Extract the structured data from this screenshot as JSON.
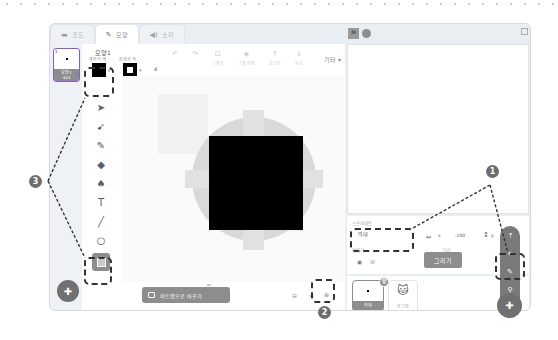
{
  "tabs": [
    {
      "label": "코드",
      "icon": "code-icon"
    },
    {
      "label": "모양",
      "icon": "brush-icon"
    },
    {
      "label": "소리",
      "icon": "speaker-icon"
    }
  ],
  "costume_list": {
    "items": [
      {
        "number": "1",
        "name": "모양1",
        "size": "4x4"
      }
    ],
    "add_button_icon": "cat-plus-icon"
  },
  "paint_editor": {
    "costume_name": "모양1",
    "fill_label": "채우기 색",
    "outline_label": "윤곽선 색",
    "outline_width": "4",
    "fill_color": "#000000",
    "outline_color": "#000000",
    "toolbar": {
      "undo": "↶",
      "redo": "↷",
      "group_label": "그룹화",
      "ungroup_label": "그룹 해제",
      "forward_label": "앞으로",
      "backward_label": "뒤로",
      "more_label": "기타 ▾"
    },
    "tools": [
      "select",
      "reshape",
      "brush",
      "eraser",
      "fill",
      "text",
      "line",
      "circle",
      "rectangle"
    ],
    "selected_tool": "rectangle",
    "convert_button": "비트맵으로 바꾸기",
    "zoom_out": "⊖",
    "zoom_reset": "=",
    "zoom_in": "⊕"
  },
  "stage": {
    "flag_icon": "green-flag-icon",
    "stop_icon": "stop-icon"
  },
  "sprite_info": {
    "sprite_label": "스프라이트",
    "sprite_name": "막대",
    "x_label": "x",
    "x_value": "-200",
    "y_label": "y",
    "show_label": "보이기",
    "size_label": "크기",
    "size_value": "36"
  },
  "sprite_menu": {
    "tooltip": "그리기",
    "items": [
      "upload-icon",
      "surprise-icon",
      "paint-icon",
      "search-icon"
    ]
  },
  "sprite_list": [
    {
      "name": "막대",
      "selected": true
    },
    {
      "name": "공그림",
      "selected": false
    }
  ],
  "callouts": {
    "one": "1",
    "two": "2",
    "three": "3"
  }
}
